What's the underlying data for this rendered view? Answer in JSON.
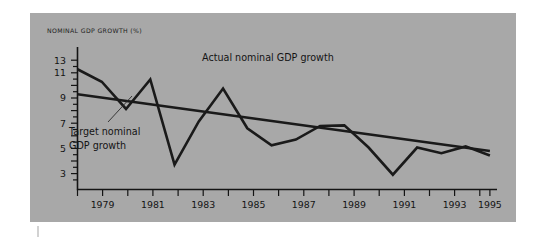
{
  "figure": {
    "background_color": "#a8a8a8",
    "page_color": "#ffffff",
    "line_color": "#1a1a1a"
  },
  "labels": {
    "y_axis_title": "NOMINAL GDP GROWTH (%)",
    "actual_series_label": "Actual nominal GDP growth",
    "target_series_label_line1": "Target nominal",
    "target_series_label_line2": "GDP growth"
  },
  "chart_data": {
    "type": "line",
    "title": "",
    "xlabel": "",
    "ylabel": "NOMINAL GDP GROWTH (%)",
    "xlim": [
      1978,
      1995.5
    ],
    "ylim": [
      2.0,
      13.6
    ],
    "grid": false,
    "legend": "annotations-inline",
    "y_ticks_labeled": [
      13,
      11,
      9,
      7,
      5,
      3
    ],
    "y_ticks_all": [
      3,
      4,
      5,
      6,
      7,
      8,
      9,
      10,
      11,
      12,
      13
    ],
    "x_ticks_labeled": [
      1979,
      1981,
      1983,
      1985,
      1987,
      1989,
      1991,
      1993,
      1995
    ],
    "x_ticks_all": [
      1978,
      1979,
      1980,
      1981,
      1982,
      1983,
      1984,
      1985,
      1986,
      1987,
      1988,
      1989,
      1990,
      1991,
      1992,
      1993,
      1994,
      1995
    ],
    "x": [
      1978,
      1979,
      1980,
      1981,
      1982,
      1983,
      1984,
      1985,
      1986,
      1987,
      1988,
      1989,
      1990,
      1991,
      1992,
      1993,
      1994,
      1995
    ],
    "series": [
      {
        "name": "Actual nominal GDP growth",
        "values": [
          12.2,
          11.1,
          8.7,
          11.3,
          3.8,
          7.6,
          10.5,
          7.0,
          5.5,
          6.0,
          7.2,
          7.25,
          5.3,
          2.9,
          5.3,
          4.8,
          5.4,
          4.6
        ]
      },
      {
        "name": "Target nominal GDP growth",
        "values": [
          10.0,
          9.7,
          9.4,
          9.1,
          8.8,
          8.5,
          8.2,
          7.9,
          7.6,
          7.3,
          7.0,
          6.7,
          6.4,
          6.1,
          5.8,
          5.5,
          5.25,
          5.0
        ]
      }
    ]
  }
}
